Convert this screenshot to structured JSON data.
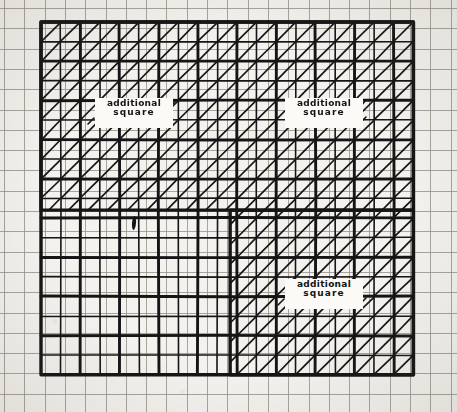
{
  "figure": {
    "background_color": "#f4f2ee",
    "ink_color": "#151515",
    "faint_grid_color": "#9a958c"
  },
  "grid": {
    "origin_x": 41,
    "origin_y": 22,
    "cell_size": 19.6,
    "columns": 19,
    "rows": 18,
    "major_every": 2,
    "minor_line_width": 1.6,
    "major_line_width": 2.9,
    "border_line_width": 3.4
  },
  "background_grid": {
    "cell_size": 20.3,
    "offset_x": 4,
    "offset_y": 8,
    "line_width": 1,
    "color": "#9a958c",
    "heavy_every": 0
  },
  "hatching": {
    "angle": "45deg-up-right",
    "line_color": "#151515",
    "line_width": 1.7,
    "regions": [
      {
        "name": "top-band",
        "col_start": 0,
        "col_end": 19,
        "row_start": 0,
        "row_end": 9.6
      },
      {
        "name": "right-lower-block",
        "col_start": 9.65,
        "col_end": 19,
        "row_start": 9.6,
        "row_end": 18
      }
    ]
  },
  "labels": [
    {
      "id": "label-upper-left",
      "line1": "additional",
      "line2": "square",
      "x": 95,
      "y": 98,
      "width": 74,
      "height": 28,
      "tick_marks": [
        "leading-lower-left",
        "trailing-upper-right"
      ]
    },
    {
      "id": "label-upper-right",
      "line1": "additional",
      "line2": "square",
      "x": 285,
      "y": 98,
      "width": 74,
      "height": 28,
      "tick_marks": [
        "trailing-upper-right",
        "trailing-lower-right"
      ]
    },
    {
      "id": "label-lower-right",
      "line1": "additional",
      "line2": "square",
      "x": 285,
      "y": 279,
      "width": 74,
      "height": 28,
      "tick_marks": [
        "leading-lower-left",
        "trailing-lower-right"
      ]
    }
  ],
  "marks": [
    {
      "id": "tally-mark",
      "description": "short thick vertical pen stroke inside an empty cell",
      "x": 132,
      "y": 216,
      "width": 4,
      "height": 14
    }
  ]
}
